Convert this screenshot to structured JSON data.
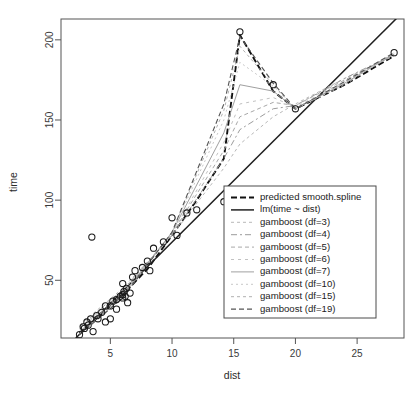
{
  "figure": {
    "title": "",
    "background": "#ffffff"
  },
  "chart_data": {
    "type": "scatter",
    "title": "",
    "xlabel": "dist",
    "ylabel": "time",
    "xlim": [
      1.0,
      28.8
    ],
    "ylim": [
      14.0,
      213.0
    ],
    "xticks": [
      5,
      10,
      15,
      20,
      25
    ],
    "yticks": [
      50,
      100,
      150,
      200
    ],
    "grid": false,
    "legend_position": "bottom-right",
    "point_marker": "open-circle",
    "point_color": "#1a1a1a",
    "points": [
      {
        "x": 2.5,
        "y": 16.083
      },
      {
        "x": 2.8,
        "y": 21.0
      },
      {
        "x": 2.9,
        "y": 20.0
      },
      {
        "x": 3.1,
        "y": 24.0
      },
      {
        "x": 3.2,
        "y": 22.0
      },
      {
        "x": 3.4,
        "y": 26.0
      },
      {
        "x": 3.5,
        "y": 77.0
      },
      {
        "x": 3.6,
        "y": 18.0
      },
      {
        "x": 3.9,
        "y": 28.0
      },
      {
        "x": 4.0,
        "y": 26.0
      },
      {
        "x": 4.3,
        "y": 30.0
      },
      {
        "x": 4.6,
        "y": 34.0
      },
      {
        "x": 4.6,
        "y": 24.0
      },
      {
        "x": 5.0,
        "y": 34.0
      },
      {
        "x": 5.0,
        "y": 26.0
      },
      {
        "x": 5.2,
        "y": 37.0
      },
      {
        "x": 5.5,
        "y": 38.0
      },
      {
        "x": 5.5,
        "y": 32.0
      },
      {
        "x": 5.8,
        "y": 40.0
      },
      {
        "x": 6.0,
        "y": 48.0
      },
      {
        "x": 6.0,
        "y": 41.0
      },
      {
        "x": 6.0,
        "y": 39.0
      },
      {
        "x": 6.1,
        "y": 43.0
      },
      {
        "x": 6.2,
        "y": 40.0
      },
      {
        "x": 6.3,
        "y": 45.0
      },
      {
        "x": 6.4,
        "y": 36.0
      },
      {
        "x": 6.6,
        "y": 42.0
      },
      {
        "x": 6.8,
        "y": 52.0
      },
      {
        "x": 7.0,
        "y": 56.0
      },
      {
        "x": 7.6,
        "y": 58.0
      },
      {
        "x": 8.0,
        "y": 62.0
      },
      {
        "x": 8.2,
        "y": 56.0
      },
      {
        "x": 8.5,
        "y": 70.0
      },
      {
        "x": 9.3,
        "y": 74.0
      },
      {
        "x": 10.0,
        "y": 89.0
      },
      {
        "x": 10.4,
        "y": 78.0
      },
      {
        "x": 11.2,
        "y": 92.0
      },
      {
        "x": 12.0,
        "y": 94.0
      },
      {
        "x": 14.2,
        "y": 99.0
      },
      {
        "x": 15.5,
        "y": 205.0
      },
      {
        "x": 18.2,
        "y": 172.0
      },
      {
        "x": 20.0,
        "y": 157.0
      },
      {
        "x": 28.0,
        "y": 192.0
      }
    ],
    "series": [
      {
        "name": "predicted smooth.spline",
        "style": "dashed-bold",
        "color": "#111111",
        "width": 1.9,
        "dash": "6,3",
        "values": [
          {
            "x": 2.5,
            "y": 17
          },
          {
            "x": 4,
            "y": 27
          },
          {
            "x": 6,
            "y": 41
          },
          {
            "x": 8,
            "y": 57
          },
          {
            "x": 10,
            "y": 78
          },
          {
            "x": 12,
            "y": 100
          },
          {
            "x": 14.2,
            "y": 126
          },
          {
            "x": 15.5,
            "y": 203
          },
          {
            "x": 18.2,
            "y": 168
          },
          {
            "x": 20,
            "y": 157
          },
          {
            "x": 24,
            "y": 172
          },
          {
            "x": 28,
            "y": 190
          }
        ]
      },
      {
        "name": "lm(time ~ dist)",
        "style": "solid",
        "color": "#202020",
        "width": 1.5,
        "dash": "none",
        "values": [
          {
            "x": 2.2,
            "y": 14
          },
          {
            "x": 28.8,
            "y": 218
          }
        ]
      },
      {
        "name": "gamboost (df=3)",
        "style": "dashed-light",
        "color": "#b8b8b8",
        "width": 1.0,
        "dash": "3,3",
        "values": [
          {
            "x": 2.5,
            "y": 22
          },
          {
            "x": 6,
            "y": 45
          },
          {
            "x": 10,
            "y": 78
          },
          {
            "x": 14.2,
            "y": 120
          },
          {
            "x": 15.5,
            "y": 135
          },
          {
            "x": 18.2,
            "y": 152
          },
          {
            "x": 20,
            "y": 160
          },
          {
            "x": 24,
            "y": 176
          },
          {
            "x": 28,
            "y": 190
          }
        ]
      },
      {
        "name": "gamboost (df=4)",
        "style": "dashdot",
        "color": "#9c9c9c",
        "width": 1.0,
        "dash": "6,3,2,3",
        "values": [
          {
            "x": 2.5,
            "y": 21
          },
          {
            "x": 6,
            "y": 44
          },
          {
            "x": 10,
            "y": 78
          },
          {
            "x": 14.2,
            "y": 126
          },
          {
            "x": 15.5,
            "y": 144
          },
          {
            "x": 18.2,
            "y": 157
          },
          {
            "x": 20,
            "y": 159
          },
          {
            "x": 24,
            "y": 176
          },
          {
            "x": 28,
            "y": 191
          }
        ]
      },
      {
        "name": "gamboost (df=5)",
        "style": "dashed-light",
        "color": "#a8a8a8",
        "width": 1.0,
        "dash": "4,3",
        "values": [
          {
            "x": 2.5,
            "y": 20
          },
          {
            "x": 6,
            "y": 43
          },
          {
            "x": 10,
            "y": 79
          },
          {
            "x": 14.2,
            "y": 131
          },
          {
            "x": 15.5,
            "y": 152
          },
          {
            "x": 18.2,
            "y": 161
          },
          {
            "x": 20,
            "y": 159
          },
          {
            "x": 24,
            "y": 175
          },
          {
            "x": 28,
            "y": 191
          }
        ]
      },
      {
        "name": "gamboost (df=6)",
        "style": "dashed-light",
        "color": "#c2c2c2",
        "width": 1.0,
        "dash": "3,4",
        "values": [
          {
            "x": 2.5,
            "y": 19
          },
          {
            "x": 6,
            "y": 42
          },
          {
            "x": 10,
            "y": 79
          },
          {
            "x": 14.2,
            "y": 136
          },
          {
            "x": 15.5,
            "y": 160
          },
          {
            "x": 18.2,
            "y": 164
          },
          {
            "x": 20,
            "y": 158
          },
          {
            "x": 24,
            "y": 174
          },
          {
            "x": 28,
            "y": 191
          }
        ]
      },
      {
        "name": "gamboost (df=7)",
        "style": "solid-light",
        "color": "#a0a0a0",
        "width": 1.0,
        "dash": "none",
        "values": [
          {
            "x": 2.5,
            "y": 18
          },
          {
            "x": 6,
            "y": 41
          },
          {
            "x": 10,
            "y": 80
          },
          {
            "x": 14.2,
            "y": 142
          },
          {
            "x": 15.5,
            "y": 172
          },
          {
            "x": 18.2,
            "y": 168
          },
          {
            "x": 20,
            "y": 157
          },
          {
            "x": 24,
            "y": 173
          },
          {
            "x": 28,
            "y": 191
          }
        ]
      },
      {
        "name": "gamboost (df=10)",
        "style": "dashed-light",
        "color": "#c8c8c8",
        "width": 1.0,
        "dash": "2,3",
        "values": [
          {
            "x": 2.5,
            "y": 17
          },
          {
            "x": 6,
            "y": 40
          },
          {
            "x": 10,
            "y": 80
          },
          {
            "x": 14.2,
            "y": 150
          },
          {
            "x": 15.5,
            "y": 186
          },
          {
            "x": 18.2,
            "y": 171
          },
          {
            "x": 20,
            "y": 157
          },
          {
            "x": 24,
            "y": 172
          },
          {
            "x": 28,
            "y": 192
          }
        ]
      },
      {
        "name": "gamboost (df=15)",
        "style": "dashed-light",
        "color": "#b0b0b0",
        "width": 1.0,
        "dash": "3,3",
        "values": [
          {
            "x": 2.5,
            "y": 16.5
          },
          {
            "x": 6,
            "y": 39.5
          },
          {
            "x": 10,
            "y": 80
          },
          {
            "x": 14.2,
            "y": 156
          },
          {
            "x": 15.5,
            "y": 196
          },
          {
            "x": 18.2,
            "y": 172
          },
          {
            "x": 20,
            "y": 157
          },
          {
            "x": 24,
            "y": 173
          },
          {
            "x": 28,
            "y": 192
          }
        ]
      },
      {
        "name": "gamboost (df=19)",
        "style": "dashed",
        "color": "#555555",
        "width": 1.1,
        "dash": "5,3",
        "values": [
          {
            "x": 2.5,
            "y": 16
          },
          {
            "x": 6,
            "y": 39
          },
          {
            "x": 10,
            "y": 80
          },
          {
            "x": 14.2,
            "y": 160
          },
          {
            "x": 15.5,
            "y": 202
          },
          {
            "x": 18.2,
            "y": 173
          },
          {
            "x": 20,
            "y": 157
          },
          {
            "x": 24,
            "y": 174
          },
          {
            "x": 28,
            "y": 192
          }
        ]
      }
    ]
  },
  "legend": {
    "entries": [
      {
        "label": "predicted smooth.spline",
        "series": 0
      },
      {
        "label": "lm(time ~ dist)",
        "series": 1
      },
      {
        "label": "gamboost (df=3)",
        "series": 2
      },
      {
        "label": "gamboost (df=4)",
        "series": 3
      },
      {
        "label": "gamboost (df=5)",
        "series": 4
      },
      {
        "label": "gamboost (df=6)",
        "series": 5
      },
      {
        "label": "gamboost (df=7)",
        "series": 6
      },
      {
        "label": "gamboost (df=10)",
        "series": 7
      },
      {
        "label": "gamboost (df=15)",
        "series": 8
      },
      {
        "label": "gamboost (df=19)",
        "series": 9
      }
    ]
  },
  "axes": {
    "x_title": "dist",
    "y_title": "time",
    "x_tick_labels": [
      "5",
      "10",
      "15",
      "20",
      "25"
    ],
    "y_tick_labels": [
      "50",
      "100",
      "150",
      "200"
    ]
  }
}
